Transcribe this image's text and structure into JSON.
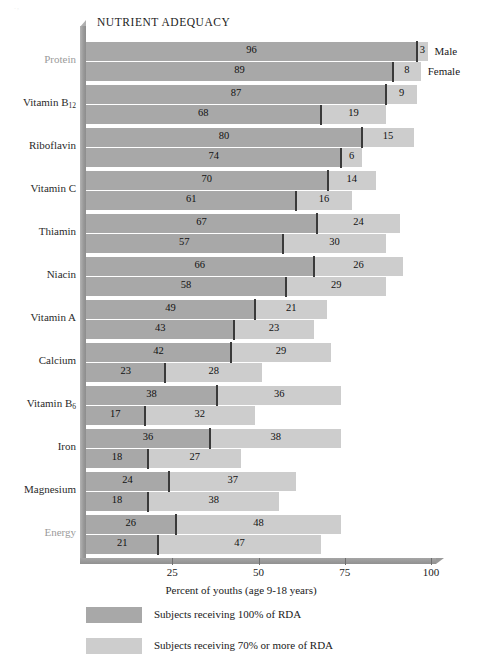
{
  "chart_data": {
    "type": "bar",
    "orientation": "horizontal",
    "stacked": true,
    "title": "NUTRIENT ADEQUACY",
    "xlabel": "Percent of youths (age 9-18 years)",
    "ylabel": "",
    "xlim": [
      0,
      100
    ],
    "xticks": [
      25,
      50,
      75,
      100
    ],
    "xticklabels": [
      "25",
      "50",
      "75",
      "100"
    ],
    "grid": false,
    "legend_position": "bottom-left",
    "group_labels": [
      "Male",
      "Female"
    ],
    "categories": [
      "Protein",
      "Vitamin B₁₂",
      "Riboflavin",
      "Vitamin C",
      "Thiamin",
      "Niacin",
      "Vitamin A",
      "Calcium",
      "Vitamin B₆",
      "Iron",
      "Magnesium",
      "Energy"
    ],
    "series": [
      {
        "name": "Subjects receiving 100% of RDA",
        "color": "#a8a8a8",
        "male": [
          96,
          87,
          80,
          70,
          67,
          66,
          49,
          42,
          38,
          36,
          24,
          26
        ],
        "female": [
          89,
          68,
          74,
          61,
          57,
          58,
          43,
          23,
          17,
          18,
          18,
          21
        ]
      },
      {
        "name": "Subjects receiving 70% or more of RDA",
        "color": "#cdcdcd",
        "male": [
          3,
          9,
          15,
          14,
          24,
          26,
          21,
          29,
          36,
          38,
          37,
          48
        ],
        "female": [
          8,
          19,
          6,
          16,
          30,
          29,
          23,
          28,
          32,
          27,
          38,
          47
        ]
      }
    ],
    "rows": [
      {
        "category": "Protein",
        "muted": true,
        "male": {
          "dark": 96,
          "light": 3
        },
        "female": {
          "dark": 89,
          "light": 8
        }
      },
      {
        "category": "Vitamin B₁₂",
        "muted": false,
        "male": {
          "dark": 87,
          "light": 9
        },
        "female": {
          "dark": 68,
          "light": 19
        }
      },
      {
        "category": "Riboflavin",
        "muted": false,
        "male": {
          "dark": 80,
          "light": 15
        },
        "female": {
          "dark": 74,
          "light": 6
        }
      },
      {
        "category": "Vitamin C",
        "muted": false,
        "male": {
          "dark": 70,
          "light": 14
        },
        "female": {
          "dark": 61,
          "light": 16
        }
      },
      {
        "category": "Thiamin",
        "muted": false,
        "male": {
          "dark": 67,
          "light": 24
        },
        "female": {
          "dark": 57,
          "light": 30
        }
      },
      {
        "category": "Niacin",
        "muted": false,
        "male": {
          "dark": 66,
          "light": 26
        },
        "female": {
          "dark": 58,
          "light": 29
        }
      },
      {
        "category": "Vitamin A",
        "muted": false,
        "male": {
          "dark": 49,
          "light": 21
        },
        "female": {
          "dark": 43,
          "light": 23
        }
      },
      {
        "category": "Calcium",
        "muted": false,
        "male": {
          "dark": 42,
          "light": 29
        },
        "female": {
          "dark": 23,
          "light": 28
        }
      },
      {
        "category": "Vitamin B₆",
        "muted": false,
        "male": {
          "dark": 38,
          "light": 36
        },
        "female": {
          "dark": 17,
          "light": 32
        }
      },
      {
        "category": "Iron",
        "muted": false,
        "male": {
          "dark": 36,
          "light": 38
        },
        "female": {
          "dark": 18,
          "light": 27
        }
      },
      {
        "category": "Magnesium",
        "muted": false,
        "male": {
          "dark": 24,
          "light": 37
        },
        "female": {
          "dark": 18,
          "light": 38
        }
      },
      {
        "category": "Energy",
        "muted": true,
        "male": {
          "dark": 26,
          "light": 48
        },
        "female": {
          "dark": 21,
          "light": 47
        }
      }
    ]
  },
  "legend": [
    {
      "label": "Subjects receiving 100% of RDA",
      "color": "#a8a8a8"
    },
    {
      "label": "Subjects receiving 70% or more of RDA",
      "color": "#cdcdcd"
    }
  ],
  "series_annotations": {
    "male": "Male",
    "female": "Female"
  }
}
